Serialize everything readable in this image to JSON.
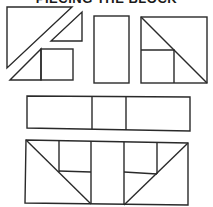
{
  "title": "PIECING THE BLOCK",
  "colors": {
    "line": "#2a2a2a",
    "background": "#ffffff"
  },
  "diagram": {
    "groups": [
      {
        "name": "split-square-pieces",
        "shapes": [
          "large triangle",
          "small triangle",
          "triangle + square unit"
        ]
      },
      {
        "name": "center-rectangle",
        "shapes": [
          "tall rectangle"
        ]
      },
      {
        "name": "assembled-corner-square",
        "shapes": [
          "square with diagonal",
          "inner small square"
        ]
      },
      {
        "name": "middle-strip",
        "shapes": [
          "rectangle",
          "narrow rectangle",
          "rectangle"
        ]
      },
      {
        "name": "assembled-row",
        "shapes": [
          "left diagonal unit",
          "center column",
          "right diagonal unit"
        ]
      }
    ]
  }
}
